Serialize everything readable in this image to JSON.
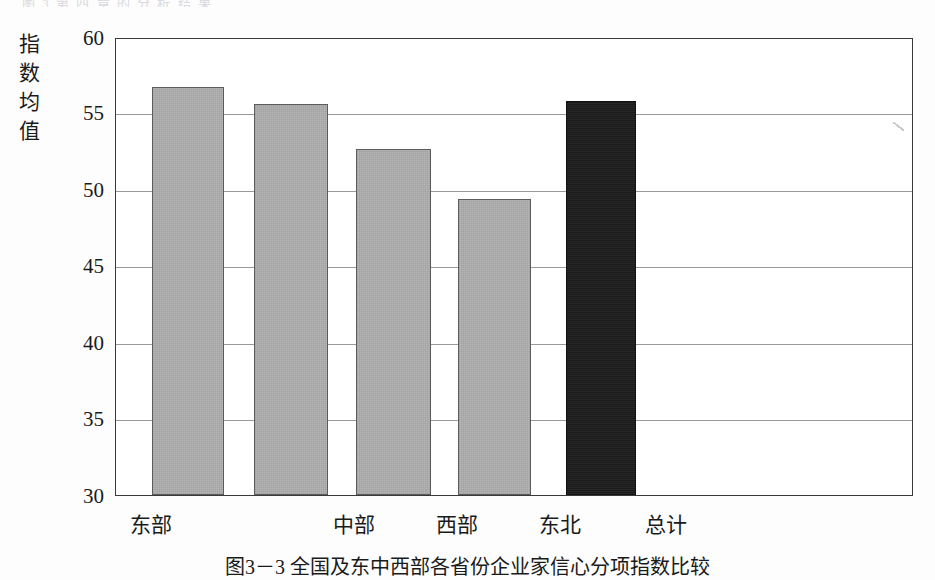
{
  "page": {
    "top_cut_text": "图 3  第 四 章 的 分 析 结 果",
    "caption": "图3－3  全国及东中西部各省份企业家信心分项指数比较"
  },
  "axis": {
    "y_label_chars": [
      "指",
      "数",
      "均",
      "值"
    ],
    "y_ticks": [
      "60",
      "55",
      "50",
      "45",
      "40",
      "35",
      "30"
    ]
  },
  "chart_data": {
    "type": "bar",
    "title": "",
    "xlabel": "",
    "ylabel": "指数均值",
    "categories": [
      "东部",
      "中部",
      "西部",
      "东北",
      "总计"
    ],
    "values": [
      56.9,
      55.8,
      52.8,
      49.5,
      56.0
    ],
    "ylim": [
      30,
      60
    ],
    "ytick_step": 5,
    "grid": true,
    "legend": "none",
    "bar_colors": [
      "#b5b5b5",
      "#b5b5b5",
      "#b5b5b5",
      "#b5b5b5",
      "#1b1b1b"
    ],
    "bar_border_color": "#5c5c5c",
    "highlight_category": "总计"
  },
  "colors": {
    "bar_gray": "#b5b5b5",
    "bar_dark": "#1b1b1b",
    "frame": "#3a3a3a",
    "gridline": "#9a9a9a",
    "text": "#1a1a1a",
    "background": "#fdfdfd"
  }
}
